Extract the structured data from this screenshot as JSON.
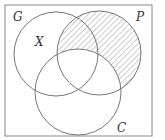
{
  "diagram": {
    "type": "venn",
    "sets": [
      {
        "id": "G",
        "label": "G"
      },
      {
        "id": "P",
        "label": "P"
      },
      {
        "id": "C",
        "label": "C"
      }
    ],
    "region_labels": [
      {
        "label": "X",
        "region": "G only"
      }
    ],
    "shaded_region": "P minus C",
    "colors": {
      "stroke": "#777777",
      "hatch": "#999999",
      "frame": "#888888"
    }
  }
}
